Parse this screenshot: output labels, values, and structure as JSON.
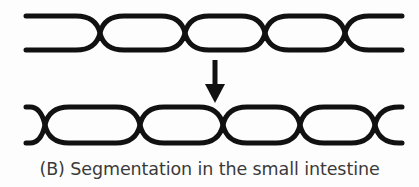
{
  "figure": {
    "panel_label": "(B)",
    "caption": "(B) Segmentation in the small intestine",
    "caption_color": "#3a3a3a",
    "background_color": "#fdfdfd",
    "line_color": "#111111",
    "arrow_color": "#111111"
  },
  "diagram": {
    "type": "intestinal-segmentation",
    "stroke_width": 5,
    "tube_upper": {
      "name": "small-intestine-before-segmentation",
      "x_start": 26,
      "x_end": 402,
      "y_top": 14,
      "y_bottom": 52,
      "constriction_x": [
        100,
        185,
        265,
        345
      ],
      "constriction_count": 4,
      "segment_count": 5
    },
    "tube_lower": {
      "name": "small-intestine-after-segmentation",
      "x_start": 26,
      "x_end": 402,
      "y_top": 105,
      "y_bottom": 145,
      "constriction_x": [
        45,
        140,
        223,
        300,
        375
      ],
      "constriction_count": 5,
      "segment_count": 6
    },
    "arrow": {
      "name": "downward-transition-arrow",
      "direction": "down",
      "x": 215,
      "y_start": 60,
      "y_end": 102,
      "shaft_width": 5,
      "head_width": 20,
      "head_height": 20
    }
  }
}
